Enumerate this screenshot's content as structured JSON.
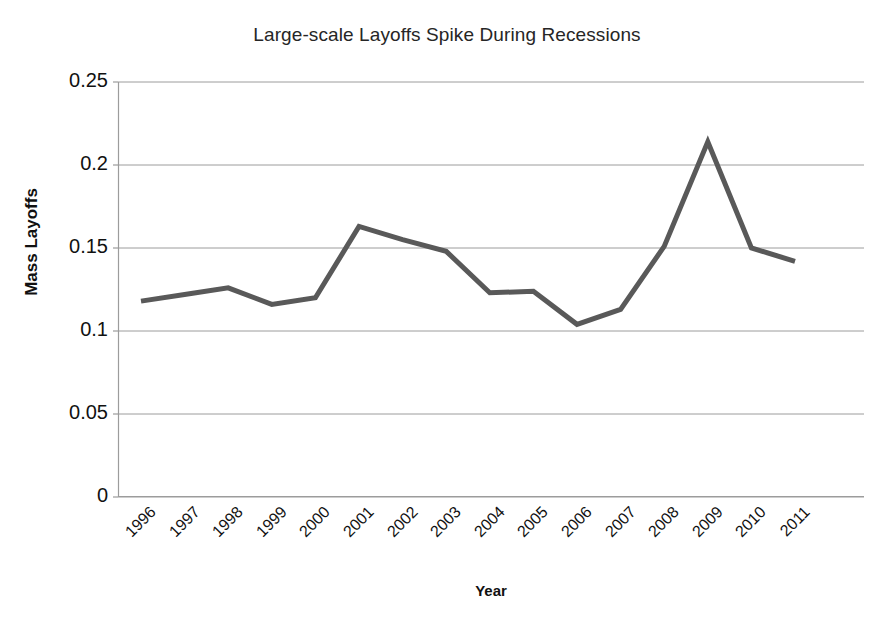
{
  "chart_data": {
    "type": "line",
    "title": "Large-scale Layoffs Spike During Recessions",
    "xlabel": "Year",
    "ylabel": "Mass Layoffs",
    "categories": [
      "1996",
      "1997",
      "1998",
      "1999",
      "2000",
      "2001",
      "2002",
      "2003",
      "2004",
      "2005",
      "2006",
      "2007",
      "2008",
      "2009",
      "2010",
      "2011"
    ],
    "values": [
      0.118,
      0.122,
      0.126,
      0.116,
      0.12,
      0.163,
      0.155,
      0.148,
      0.123,
      0.124,
      0.104,
      0.113,
      0.151,
      0.214,
      0.15,
      0.142
    ],
    "series": [
      {
        "name": "Mass Layoffs",
        "color": "#595959",
        "values": [
          0.118,
          0.122,
          0.126,
          0.116,
          0.12,
          0.163,
          0.155,
          0.148,
          0.123,
          0.124,
          0.104,
          0.113,
          0.151,
          0.214,
          0.15,
          0.142
        ]
      }
    ],
    "ylim": [
      0,
      0.25
    ],
    "yticks": [
      0,
      0.05,
      0.1,
      0.15,
      0.2,
      0.25
    ],
    "ytick_labels": [
      "0",
      "0.05",
      "0.1",
      "0.15",
      "0.2",
      "0.25"
    ],
    "grid": "horizontal",
    "legend": "none",
    "line_color": "#595959",
    "line_width": 5,
    "gridline_color": "#9c9c9c",
    "axis_color": "#9c9c9c",
    "background": "#ffffff"
  }
}
